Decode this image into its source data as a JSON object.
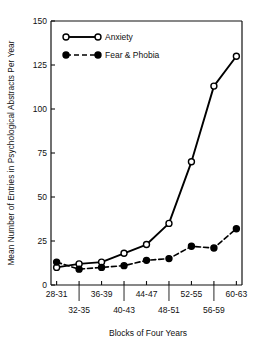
{
  "chart_data": {
    "type": "line",
    "title": "",
    "xlabel": "Blocks of Four Years",
    "ylabel": "Mean Number of Entries in Psychological Abstracts Per Year",
    "categories": [
      "28-31",
      "32-35",
      "36-39",
      "40-43",
      "44-47",
      "48-51",
      "52-55",
      "56-59",
      "60-63"
    ],
    "x": [
      0,
      1,
      2,
      3,
      4,
      5,
      6,
      7,
      8
    ],
    "xlim": [
      -0.25,
      8.25
    ],
    "ylim": [
      0,
      150
    ],
    "yticks": [
      0,
      25,
      50,
      75,
      100,
      125,
      150
    ],
    "ytick_labels": [
      "0",
      "25",
      "50",
      "75",
      "100",
      "125",
      "150"
    ],
    "grid": false,
    "legend_position": "top-left",
    "series": [
      {
        "name": "Anxiety",
        "marker": "open-circle",
        "line_style": "solid",
        "color": "#000000",
        "values": [
          10,
          12,
          13,
          18,
          23,
          35,
          70,
          113,
          130
        ]
      },
      {
        "name": "Fear & Phobia",
        "marker": "filled-circle",
        "line_style": "dashed",
        "color": "#000000",
        "values": [
          13,
          9,
          10,
          11,
          14,
          15,
          22,
          21,
          32
        ]
      }
    ],
    "xtick_labels_top": [
      "28-31",
      "36-39",
      "44-47",
      "52-55",
      "60-63"
    ],
    "xtick_labels_bottom": [
      "32-35",
      "40-43",
      "48-51",
      "56-59"
    ]
  },
  "axis": {
    "y_title": "Mean Number of Entries in Psychological Abstracts Per Year",
    "x_title": "Blocks of Four Years"
  },
  "legend": {
    "items": [
      {
        "label": "Anxiety",
        "marker": "open-circle",
        "line": "solid"
      },
      {
        "label": "Fear & Phobia",
        "marker": "filled-circle",
        "line": "dashed"
      }
    ]
  },
  "colors": {
    "ink": "#111111",
    "line": "#000000",
    "background": "#ffffff"
  }
}
